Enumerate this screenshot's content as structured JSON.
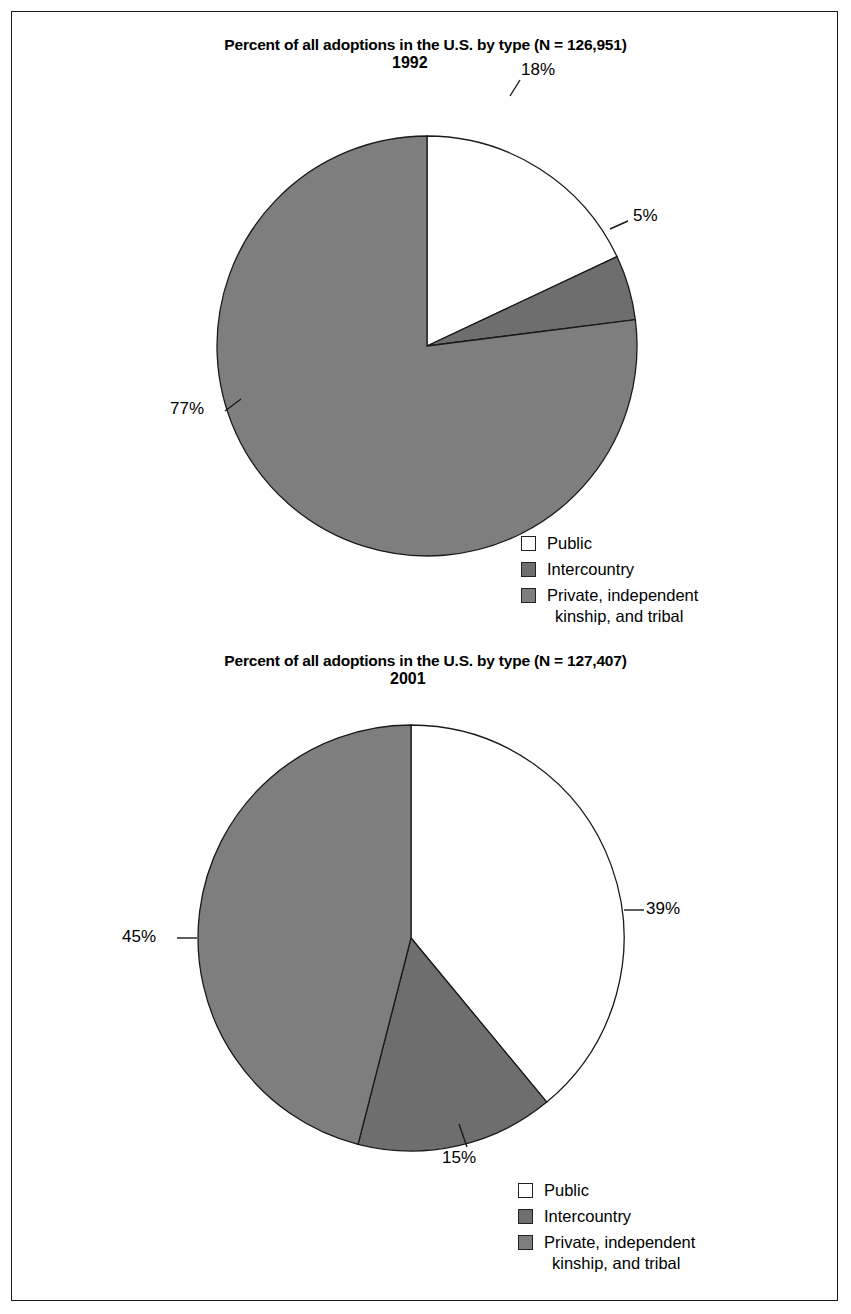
{
  "page": {
    "background": "#ffffff",
    "frame_color": "#1a1a1a"
  },
  "palette": {
    "public": "#ffffff",
    "intercountry": "#6e6e6e",
    "private": "#7e7e7e",
    "outline": "#222222",
    "text": "#000000"
  },
  "legend_labels": {
    "public": "Public",
    "intercountry": "Intercountry",
    "private_line1": "Private, independent",
    "private_line2": "kinship, and tribal"
  },
  "charts": [
    {
      "title": "Percent of all adoptions in the U.S. by type (N = 126,951)",
      "year": "1992",
      "n_label": "N = 126,951",
      "labels": {
        "public": "18%",
        "intercountry": "5%",
        "private": "77%"
      }
    },
    {
      "title": "Percent of all adoptions in the U.S. by type (N = 127,407)",
      "year": "2001",
      "n_label": "N = 127,407",
      "labels": {
        "public": "39%",
        "intercountry": "15%",
        "private": "45%"
      }
    }
  ],
  "chart_data": [
    {
      "type": "pie",
      "title": "Percent of all adoptions in the U.S. by type (N = 126,951)",
      "subtitle": "1992",
      "total_n": 126951,
      "categories": [
        "Public",
        "Intercountry",
        "Private, independent kinship, and tribal"
      ],
      "values": [
        18,
        77,
        5
      ],
      "slices": [
        {
          "label": "Public",
          "value": 18,
          "display": "18%",
          "color": "#ffffff",
          "start_deg": 0,
          "end_deg": 64.8
        },
        {
          "label": "Intercountry",
          "value": 5,
          "display": "5%",
          "color": "#6e6e6e",
          "start_deg": 64.8,
          "end_deg": 82.8
        },
        {
          "label": "Private, independent kinship, and tribal",
          "value": 77,
          "display": "77%",
          "color": "#7e7e7e",
          "start_deg": 82.8,
          "end_deg": 360
        }
      ],
      "units": "percent",
      "start_angle": "12 o'clock",
      "direction": "clockwise",
      "legend_position": "bottom-right"
    },
    {
      "type": "pie",
      "title": "Percent of all adoptions in the U.S. by type (N = 127,407)",
      "subtitle": "2001",
      "total_n": 127407,
      "categories": [
        "Public",
        "Intercountry",
        "Private, independent kinship, and tribal"
      ],
      "values": [
        39,
        45,
        15
      ],
      "slices": [
        {
          "label": "Public",
          "value": 39,
          "display": "39%",
          "color": "#ffffff",
          "start_deg": 0,
          "end_deg": 140.4
        },
        {
          "label": "Intercountry",
          "value": 15,
          "display": "15%",
          "color": "#6e6e6e",
          "start_deg": 140.4,
          "end_deg": 194.4
        },
        {
          "label": "Private, independent kinship, and tribal",
          "value": 45,
          "display": "45%",
          "color": "#7e7e7e",
          "start_deg": 194.4,
          "end_deg": 360
        }
      ],
      "units": "percent",
      "start_angle": "12 o'clock",
      "direction": "clockwise",
      "legend_position": "bottom-right"
    }
  ]
}
